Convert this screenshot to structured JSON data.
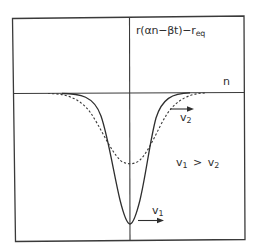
{
  "figure": {
    "y_axis_label": {
      "prefix": "r(αn−βt)−r",
      "subscript": "eq"
    },
    "x_axis_label": "n",
    "wave_2": {
      "velocity_symbol": "v",
      "velocity_subscript": "2",
      "style": "dashed"
    },
    "wave_1": {
      "velocity_symbol": "v",
      "velocity_subscript": "1",
      "style": "solid"
    },
    "relation": {
      "left_symbol": "v",
      "left_subscript": "1",
      "operator": ">",
      "right_symbol": "v",
      "right_subscript": "2"
    },
    "colors": {
      "line": "#2e2e2e",
      "background": "#ffffff"
    }
  }
}
